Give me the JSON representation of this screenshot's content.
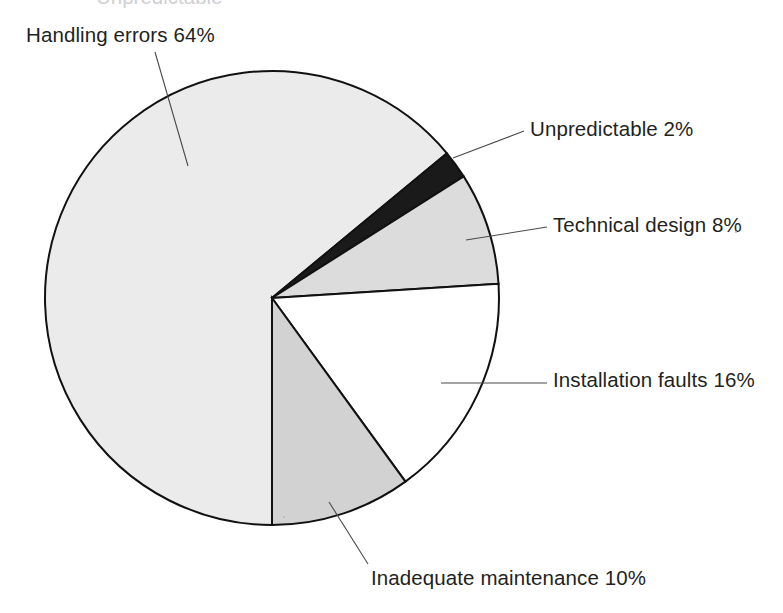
{
  "figure": {
    "background_color": "#ffffff",
    "outline_color": "#111111",
    "leader_line_color": "#4a4a4a",
    "text_color": "#231f20",
    "cropped_top_text": "Unpredictable"
  },
  "chart_data": {
    "type": "pie",
    "title": "",
    "subtitle": "",
    "xlabel": "",
    "ylabel": "",
    "grid": false,
    "legend": "none",
    "labels_position": "outside-with-leader-lines",
    "units": "percent",
    "total": 100,
    "categories": [
      "Handling errors",
      "Unpredictable",
      "Technical design",
      "Installation faults",
      "Inadequate maintenance"
    ],
    "values": [
      64,
      2,
      8,
      16,
      10
    ],
    "slices": [
      {
        "name": "Handling errors",
        "value": 64,
        "label": "Handling errors 64%",
        "color": "#ebebeb",
        "start_angle": 90,
        "sweep": 230.4
      },
      {
        "name": "Unpredictable",
        "value": 2,
        "label": "Unpredictable 2%",
        "color": "#1a1a1a",
        "start_angle": 320.4,
        "sweep": 7.2
      },
      {
        "name": "Technical design",
        "value": 8,
        "label": "Technical design 8%",
        "color": "#dcdcdc",
        "start_angle": 327.6,
        "sweep": 28.8
      },
      {
        "name": "Installation faults",
        "value": 16,
        "label": "Installation faults 16%",
        "color": "#ffffff",
        "start_angle": 356.4,
        "sweep": 57.6
      },
      {
        "name": "Inadequate maintenance",
        "value": 10,
        "label": "Inadequate maintenance 10%",
        "color": "#d2d2d2",
        "start_angle": 54,
        "sweep": 36
      }
    ]
  },
  "labels": {
    "handling_errors": "Handling errors 64%",
    "unpredictable": "Unpredictable 2%",
    "technical_design": "Technical design 8%",
    "installation_faults": "Installation faults 16%",
    "inadequate_maintenance": "Inadequate maintenance 10%"
  }
}
